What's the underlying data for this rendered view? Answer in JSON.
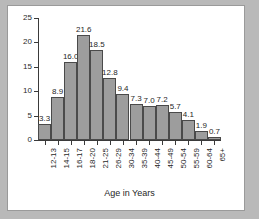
{
  "chart_data": {
    "type": "bar",
    "title": "",
    "xlabel": "Age in Years",
    "ylabel": "",
    "ylim": [
      0,
      25
    ],
    "yticks": [
      0,
      5,
      10,
      15,
      20,
      25
    ],
    "grid": false,
    "legend": false,
    "categories": [
      "12-13",
      "14-15",
      "16-17",
      "18-20",
      "21-25",
      "26-29",
      "30-34",
      "35-39",
      "40-44",
      "45-49",
      "50-54",
      "55-59",
      "60-64",
      "65+"
    ],
    "values": [
      3.3,
      8.9,
      16.0,
      21.6,
      18.5,
      12.8,
      9.4,
      7.3,
      7.0,
      7.2,
      5.7,
      4.1,
      1.9,
      0.7
    ],
    "value_labels": [
      "3.3",
      "8.9",
      "16.0",
      "21.6",
      "18.5",
      "12.8",
      "9.4",
      "7.3",
      "7.0",
      "7.2",
      "5.7",
      "4.1",
      "1.9",
      "0.7"
    ],
    "ytick_labels": [
      "0",
      "5",
      "10",
      "15",
      "20",
      "25"
    ],
    "bar_color": "#9d9d9d",
    "bar_edge_color": "#4a4a4a",
    "axis_color": "#3a3a3a",
    "panel_color": "#ffffff",
    "background_color": "#b9b9b9"
  }
}
